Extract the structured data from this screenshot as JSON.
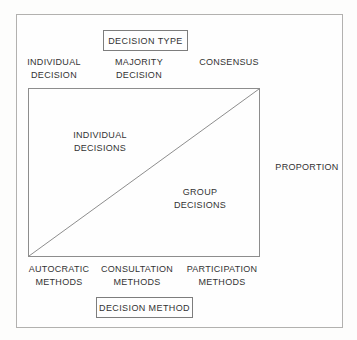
{
  "diagram": {
    "title_box": {
      "label": "DECISION TYPE"
    },
    "footer_box": {
      "label": "DECISION METHOD"
    },
    "right_axis": {
      "label": "PROPORTION"
    },
    "top_axis": [
      {
        "line1": "INDIVIDUAL",
        "line2": "DECISION"
      },
      {
        "line1": "MAJORITY",
        "line2": "DECISION"
      },
      {
        "line1": "CONSENSUS",
        "line2": ""
      }
    ],
    "bottom_axis": [
      {
        "line1": "AUTOCRATIC",
        "line2": "METHODS"
      },
      {
        "line1": "CONSULTATION",
        "line2": "METHODS"
      },
      {
        "line1": "PARTICIPATION",
        "line2": "METHODS"
      }
    ],
    "regions": [
      {
        "line1": "INDIVIDUAL",
        "line2": "DECISIONS"
      },
      {
        "line1": "GROUP",
        "line2": "DECISIONS"
      }
    ],
    "colors": {
      "line": "#8d8d8d",
      "box_border": "#7d7d7d",
      "outer_border": "#b2b1af",
      "text": "#333333",
      "background": "#fefefe"
    }
  }
}
